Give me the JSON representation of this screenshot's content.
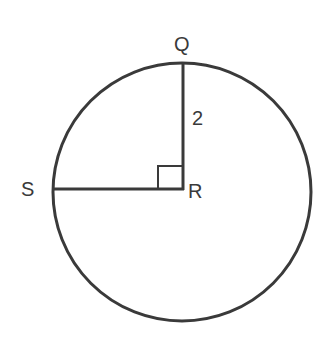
{
  "figure": {
    "type": "geometry-diagram",
    "background_color": "#ffffff",
    "stroke_color": "#3a3a3a",
    "text_color": "#3a3a3a",
    "canvas": {
      "width": 332,
      "height": 341
    }
  },
  "circle": {
    "name": "circle-R",
    "center": {
      "x": 182,
      "y": 192
    },
    "radius": 129,
    "stroke_width": 3
  },
  "points": {
    "Q": {
      "label": "Q",
      "x": 182,
      "y": 63,
      "description": "top of circle"
    },
    "R": {
      "label": "R",
      "x": 182,
      "y": 189,
      "description": "center of circle"
    },
    "S": {
      "label": "S",
      "x": 53,
      "y": 189,
      "description": "left of circle"
    }
  },
  "segments": [
    {
      "name": "segment-QR",
      "from": "Q",
      "to": "R",
      "x1": 183,
      "y1": 63,
      "x2": 183,
      "y2": 189,
      "length_label": "2",
      "stroke_width": 3
    },
    {
      "name": "segment-SR",
      "from": "S",
      "to": "R",
      "x1": 53,
      "y1": 189,
      "x2": 183,
      "y2": 189,
      "length_label": "",
      "stroke_width": 3
    }
  ],
  "measurements": {
    "radius_label": "2",
    "radius_label_x": 199,
    "radius_label_y": 120
  },
  "right_angle_marker": {
    "name": "right-angle-marker-QRS",
    "at_point": "R",
    "x": 158,
    "y": 166,
    "width": 25,
    "height": 23,
    "stroke_width": 2,
    "angle_degrees": 90
  }
}
